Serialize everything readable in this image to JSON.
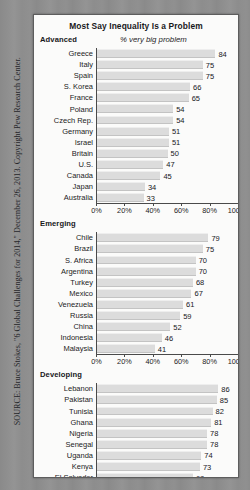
{
  "source_note": "SOURCE: Bruce Stokes, \"6 Global Challenges for 2014,\" December 26, 2013. Copyright Pew Research Center.",
  "chart_data": {
    "type": "bar",
    "orientation": "horizontal",
    "title": "Most Say Inequality Is a Problem",
    "value_caption": "% very big problem",
    "xlabel": "",
    "ylabel": "",
    "xlim": [
      0,
      100
    ],
    "grid": false,
    "legend": "none",
    "axis_ticks": [
      "0%",
      "20%",
      "40%",
      "60%",
      "80%",
      "100%"
    ],
    "axis_tick_values": [
      0,
      20,
      40,
      60,
      80,
      100
    ],
    "groups": [
      {
        "label": "Advanced",
        "categories": [
          "Greece",
          "Italy",
          "Spain",
          "S. Korea",
          "France",
          "Poland",
          "Czech Rep.",
          "Germany",
          "Israel",
          "Britain",
          "U.S.",
          "Canada",
          "Japan",
          "Australia"
        ],
        "values": [
          84,
          75,
          75,
          66,
          65,
          54,
          54,
          51,
          51,
          50,
          47,
          45,
          34,
          33
        ]
      },
      {
        "label": "Emerging",
        "categories": [
          "Chile",
          "Brazil",
          "S. Africa",
          "Argentina",
          "Turkey",
          "Mexico",
          "Venezuela",
          "Russia",
          "China",
          "Indonesia",
          "Malaysia"
        ],
        "values": [
          79,
          75,
          70,
          70,
          68,
          67,
          61,
          59,
          52,
          46,
          41
        ]
      },
      {
        "label": "Developing",
        "categories": [
          "Lebanon",
          "Pakistan",
          "Tunisia",
          "Ghana",
          "Nigeria",
          "Senegal",
          "Uganda",
          "Kenya",
          "El Salvador",
          "Palest. ter.",
          "Bolivia",
          "Philippines",
          "Egypt",
          "Jordan"
        ],
        "values": [
          86,
          85,
          82,
          81,
          78,
          78,
          74,
          73,
          68,
          60,
          58,
          53,
          49,
          44
        ]
      }
    ],
    "colors": {
      "bar": "#dcdcdc",
      "axis": "#4a4a4a",
      "text": "#1b1b1d",
      "card": "#fbfbfa",
      "page": "#8f8f8f"
    }
  }
}
